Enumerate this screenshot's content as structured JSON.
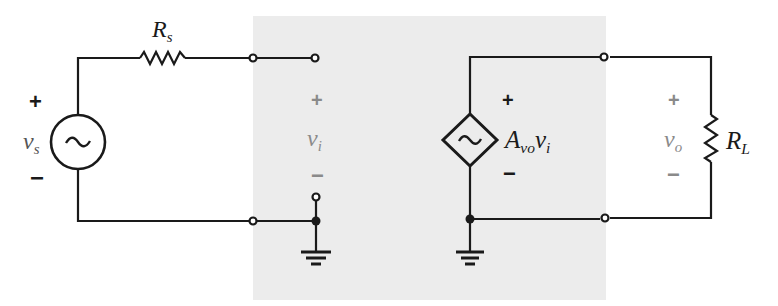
{
  "diagram": {
    "colors": {
      "amplifier_box": "#ececec",
      "wire": "#1a1a1a",
      "grey_label": "#8a8a8a"
    },
    "source": {
      "label_main": "v",
      "label_sub": "s",
      "plus": "+",
      "minus": "−",
      "icon": "ac-voltage-source-icon"
    },
    "source_resistor": {
      "label_main": "R",
      "label_sub": "s"
    },
    "input": {
      "label_main": "v",
      "label_sub": "i",
      "plus": "+",
      "minus": "−"
    },
    "controlled_source": {
      "label_main": "A",
      "label_sub": "vo",
      "label_tail": "v",
      "label_tail_sub": "i",
      "plus": "+",
      "minus": "−",
      "icon": "dependent-voltage-source-icon"
    },
    "output": {
      "label_main": "v",
      "label_sub": "o",
      "plus": "+",
      "minus": "−"
    },
    "load_resistor": {
      "label_main": "R",
      "label_sub": "L"
    }
  }
}
